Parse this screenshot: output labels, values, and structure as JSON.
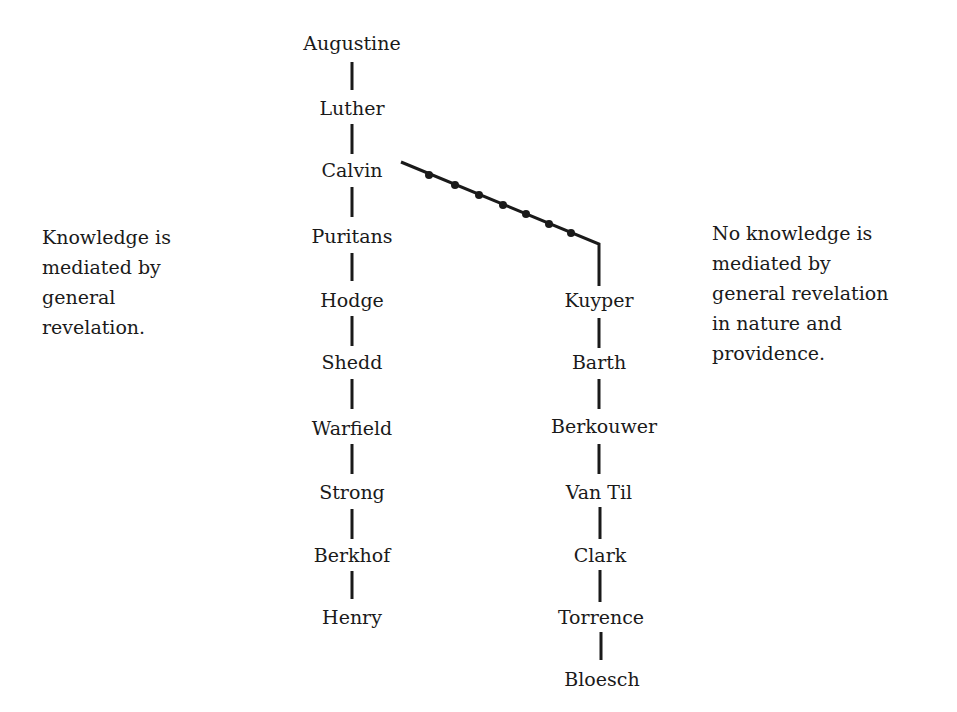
{
  "diagram": {
    "left_lineage": {
      "names": [
        "Augustine",
        "Luther",
        "Calvin",
        "Puritans",
        "Hodge",
        "Shedd",
        "Warfield",
        "Strong",
        "Berkhof",
        "Henry"
      ],
      "caption": "Knowledge is\nmediated by\ngeneral\nrevelation."
    },
    "right_lineage": {
      "branches_from": "Calvin",
      "names": [
        "Kuyper",
        "Barth",
        "Berkouwer",
        "Van Til",
        "Clark",
        "Torrence",
        "Bloesch"
      ],
      "caption": "No knowledge is\nmediated by\ngeneral revelation\nin nature and\nprovidence."
    },
    "colors": {
      "ink": "#1a1a1a",
      "background": "#ffffff"
    }
  }
}
